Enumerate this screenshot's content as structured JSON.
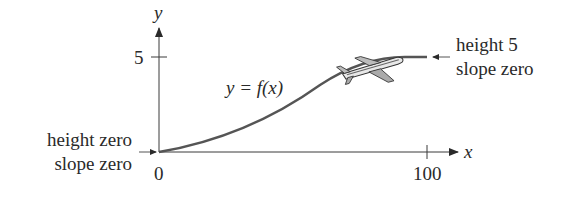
{
  "diagram": {
    "axes": {
      "x_label": "x",
      "y_label": "y",
      "x_ticks": [
        {
          "value": 0,
          "label": "0"
        },
        {
          "value": 100,
          "label": "100"
        }
      ],
      "y_ticks": [
        {
          "value": 5,
          "label": "5"
        }
      ]
    },
    "curve": {
      "label": "y = f(x)",
      "description": "smooth S-shaped curve from (0,0) to (100,5)"
    },
    "annotations": {
      "start": {
        "line1": "height zero",
        "line2": "slope zero"
      },
      "end": {
        "line1": "height 5",
        "line2": "slope zero"
      }
    },
    "icon": "airplane-icon",
    "colors": {
      "axis": "#3a3a3a",
      "curve": "#555555",
      "text": "#2a2a2a"
    }
  }
}
